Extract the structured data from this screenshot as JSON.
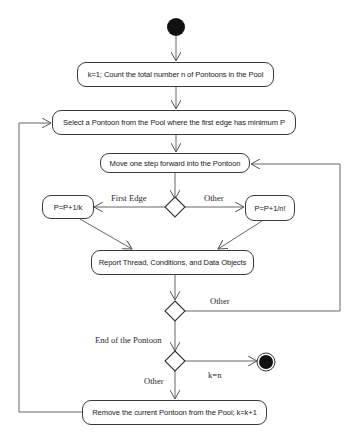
{
  "diagram": {
    "type": "uml-activity-diagram",
    "nodes": {
      "start": {
        "kind": "initial"
      },
      "init": {
        "label": "k=1; Count the total number n of Pontoons in the Pool"
      },
      "select": {
        "label": "Select a Pontoon from the Pool where the first edge has minimum P"
      },
      "move": {
        "label": "Move one step forward into the Pontoon"
      },
      "p_first": {
        "label": "P=P+1/k"
      },
      "p_other": {
        "label": "P=P+1/n!"
      },
      "report": {
        "label": "Report Thread, Conditions, and Data Objects"
      },
      "remove": {
        "label": "Remove the current Pontoon from the Pool; k=k+1"
      },
      "end": {
        "kind": "final"
      }
    },
    "edge_labels": {
      "first_edge": "First Edge",
      "other_right": "Other",
      "other_loop": "Other",
      "end_of_pontoon": "End of the Pontoon",
      "k_equals_n": "k=n",
      "other_down": "Other"
    },
    "colors": {
      "line": "#555555",
      "border": "#3a3a3a",
      "fill_dark": "#111111",
      "background": "#ffffff"
    }
  }
}
